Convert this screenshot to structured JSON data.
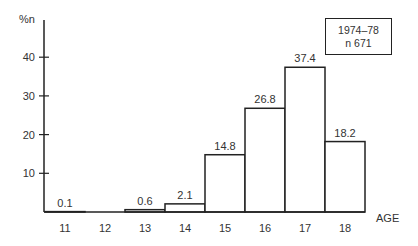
{
  "chart_data": {
    "type": "bar",
    "title": "",
    "xlabel": "AGE",
    "ylabel": "%n",
    "ylim": [
      0,
      45
    ],
    "yticks": [
      10,
      20,
      30,
      40
    ],
    "grid": false,
    "categories": [
      "11",
      "12",
      "13",
      "14",
      "15",
      "16",
      "17",
      "18"
    ],
    "values": [
      0.1,
      0,
      0.6,
      2.1,
      14.8,
      26.8,
      37.4,
      18.2
    ],
    "data_labels": [
      "0.1",
      "",
      "0.6",
      "2.1",
      "14.8",
      "26.8",
      "37.4",
      "18.2"
    ],
    "legend": {
      "position": "top-right",
      "lines": [
        "1974–78",
        "n 671"
      ]
    }
  },
  "legend": {
    "line1": "1974–78",
    "line2": "n 671"
  }
}
